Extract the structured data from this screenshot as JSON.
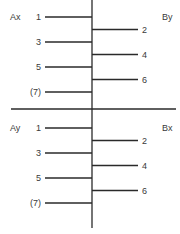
{
  "panels": [
    {
      "left_label": "Ax",
      "right_label": "By",
      "left_items": [
        "1",
        "3",
        "5",
        "(7)"
      ],
      "right_items": [
        "2",
        "4",
        "6"
      ]
    },
    {
      "left_label": "Ay",
      "right_label": "Bx",
      "left_items": [
        "1",
        "3",
        "5",
        "(7)"
      ],
      "right_items": [
        "2",
        "4",
        "6"
      ]
    }
  ]
}
